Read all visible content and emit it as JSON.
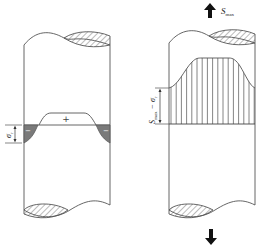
{
  "figure": {
    "left_panel": {
      "description": "Residual stress distribution in cylinder before loading",
      "positive_sign": "+",
      "negative_sign": "−",
      "dimension_label": "σ",
      "dimension_subscript": "r"
    },
    "right_panel": {
      "description": "Stress distribution under maximum load",
      "load_label": "S",
      "load_subscript": "max",
      "dimension_label_main": "S",
      "dimension_label_sub": "max",
      "dimension_label_rest": " − σ",
      "dimension_label_rest_sub": "r"
    }
  },
  "colors": {
    "outline": "#555555",
    "shade": "#7a7a7a",
    "hatch": "#666666",
    "arrow": "#111111"
  }
}
